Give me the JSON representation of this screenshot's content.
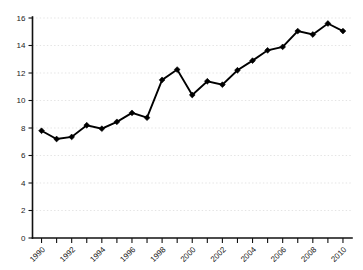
{
  "chart_data": {
    "type": "line",
    "title": "",
    "subtitle": "",
    "xlabel": "",
    "ylabel": "",
    "x": [
      1990,
      1991,
      1992,
      1993,
      1994,
      1995,
      1996,
      1997,
      1998,
      1999,
      2000,
      2001,
      2002,
      2003,
      2004,
      2005,
      2006,
      2007,
      2008,
      2009,
      2010
    ],
    "values": [
      7.8,
      7.2,
      7.35,
      8.2,
      7.95,
      8.45,
      9.1,
      8.75,
      11.5,
      12.25,
      10.4,
      11.4,
      11.15,
      12.2,
      12.9,
      13.65,
      13.9,
      15.05,
      14.8,
      15.6,
      15.05
    ],
    "series": [
      {
        "name": "series-1",
        "values": [
          7.8,
          7.2,
          7.35,
          8.2,
          7.95,
          8.45,
          9.1,
          8.75,
          11.5,
          12.25,
          10.4,
          11.4,
          11.15,
          12.2,
          12.9,
          13.65,
          13.9,
          15.05,
          14.8,
          15.6,
          15.05
        ],
        "color": "#000000",
        "marker": "diamond"
      }
    ],
    "xlim": [
      1989.4,
      2010.6
    ],
    "ylim": [
      0,
      16
    ],
    "y_ticks": [
      0,
      2,
      4,
      6,
      8,
      10,
      12,
      14,
      16
    ],
    "y_tick_labels": [
      "0",
      "2",
      "4",
      "6",
      "8",
      "10",
      "12",
      "14",
      "16"
    ],
    "x_ticks": [
      1990,
      1991,
      1992,
      1993,
      1994,
      1995,
      1996,
      1997,
      1998,
      1999,
      2000,
      2001,
      2002,
      2003,
      2004,
      2005,
      2006,
      2007,
      2008,
      2009,
      2010
    ],
    "x_tick_labels_shown": [
      "1990",
      "1992",
      "1994",
      "1996",
      "1998",
      "2000",
      "2002",
      "2004",
      "2006",
      "2008",
      "2010"
    ],
    "x_label_rotation": -45,
    "grid": {
      "horizontal": true,
      "vertical": false,
      "style": "dashed",
      "color": "#d8d8d8"
    },
    "legend": {
      "visible": false,
      "position": "none",
      "entries": []
    },
    "annotations": [],
    "background_color": "#ffffff",
    "axis_color": "#101010",
    "text_color": "#1a1a1a"
  }
}
